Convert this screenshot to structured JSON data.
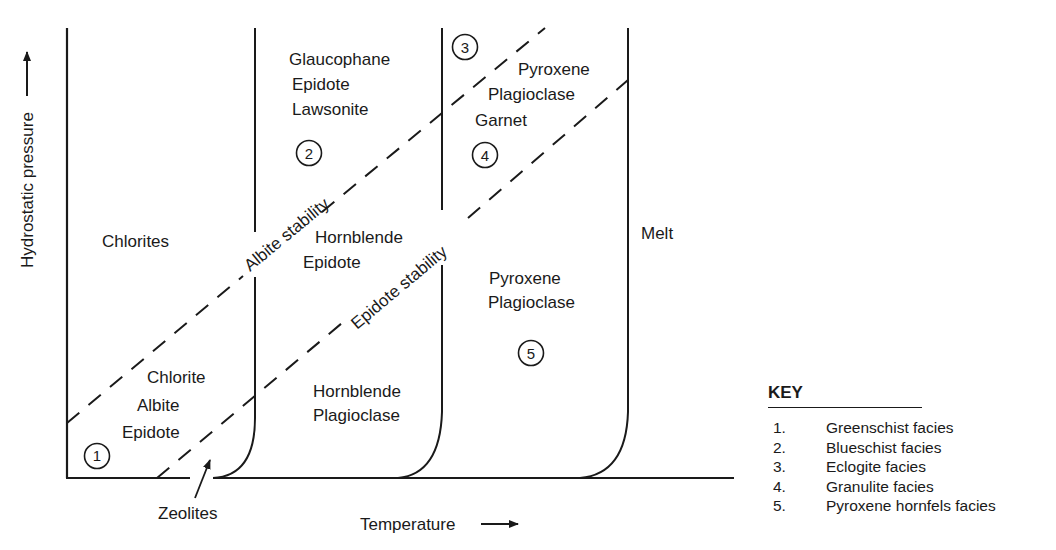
{
  "axes": {
    "y_label": "Hydrostatic pressure",
    "x_label": "Temperature"
  },
  "regions": {
    "chlorites": "Chlorites",
    "facies1_minerals": [
      "Chlorite",
      "Albite",
      "Epidote"
    ],
    "facies2_minerals": [
      "Glaucophane",
      "Epidote",
      "Lawsonite"
    ],
    "hornblende_epidote": [
      "Hornblende",
      "Epidote"
    ],
    "hornblende_plagioclase": [
      "Hornblende",
      "Plagioclase"
    ],
    "facies3_4_minerals": [
      "Pyroxene",
      "Plagioclase",
      "Garnet"
    ],
    "facies5_minerals": [
      "Pyroxene",
      "Plagioclase"
    ],
    "melt": "Melt",
    "zeolites": "Zeolites"
  },
  "stability_lines": {
    "albite": "Albite stability",
    "epidote": "Epidote stability"
  },
  "markers": [
    "1",
    "2",
    "3",
    "4",
    "5"
  ],
  "key": {
    "title": "KEY",
    "items": [
      {
        "n": "1.",
        "label": "Greenschist facies"
      },
      {
        "n": "2.",
        "label": "Blueschist facies"
      },
      {
        "n": "3.",
        "label": "Eclogite facies"
      },
      {
        "n": "4.",
        "label": "Granulite facies"
      },
      {
        "n": "5.",
        "label": "Pyroxene hornfels facies"
      }
    ]
  }
}
